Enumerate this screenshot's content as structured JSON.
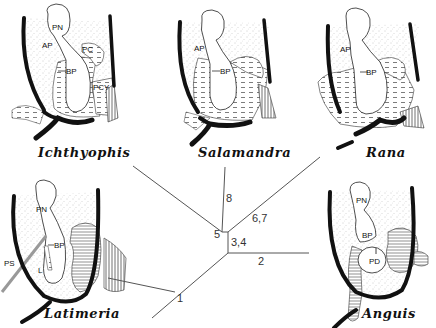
{
  "figure": {
    "type": "phylogenetic-diagram"
  },
  "panels": [
    {
      "taxon": "Ichthyophis",
      "labels": [
        "PN",
        "AP",
        "BP",
        "PC",
        "PCY"
      ]
    },
    {
      "taxon": "Salamandra",
      "labels": [
        "AP",
        "BP"
      ]
    },
    {
      "taxon": "Rana",
      "labels": [
        "AP",
        "BP"
      ]
    },
    {
      "taxon": "Latimeria",
      "labels": [
        "PN",
        "BP",
        "PS",
        "L"
      ]
    },
    {
      "taxon": "Anguis",
      "labels": [
        "PN",
        "BP",
        "PD"
      ]
    }
  ],
  "tree": {
    "branch_labels": [
      "8",
      "5",
      "6,7",
      "3,4",
      "2",
      "1"
    ]
  },
  "colors": {
    "ink": "#111111",
    "line": "#555555",
    "stipple": "#bdbdbd",
    "background": "#ffffff"
  }
}
